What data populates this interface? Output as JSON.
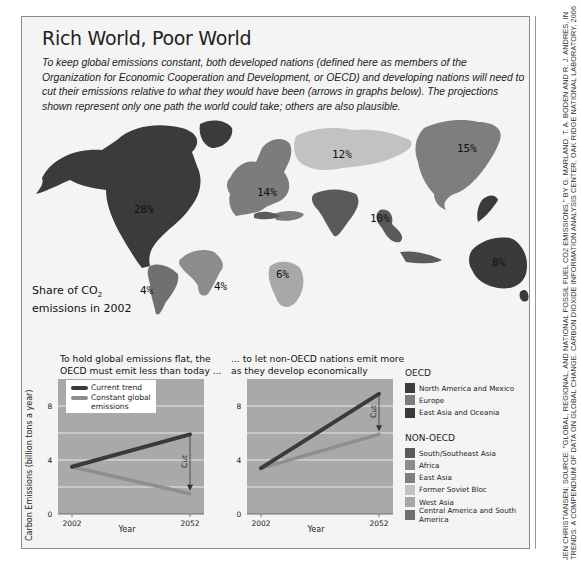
{
  "title": "Rich World, Poor World",
  "intro": "To keep global emissions constant, both developed nations (defined here as members of the Organization for Economic Cooperation and Development, or OECD) and developing nations will need to cut their emissions relative to what they would have been (arrows in graphs below). The projections shown represent only one path the world could take; others are also plausible.",
  "map": {
    "label_line1": "Share of CO",
    "label_sub": "2",
    "label_line2": "emissions in 2002",
    "regions": [
      {
        "name": "North America and Mexico",
        "group": "OECD",
        "share": "28%",
        "color": "#3b3b3b"
      },
      {
        "name": "Europe",
        "group": "OECD",
        "share": "14%",
        "color": "#7c7c7c"
      },
      {
        "name": "East Asia and Oceania",
        "group": "OECD",
        "share": "8%",
        "color": "#3a3a3a"
      },
      {
        "name": "South/Southeast Asia",
        "group": "NON-OECD",
        "share": "10%",
        "color": "#5a5a5a"
      },
      {
        "name": "Africa",
        "group": "NON-OECD",
        "share": "4%",
        "color": "#8c8c8c"
      },
      {
        "name": "East Asia",
        "group": "NON-OECD",
        "share": "15%",
        "color": "#7e7e7e"
      },
      {
        "name": "Former Soviet Bloc",
        "group": "NON-OECD",
        "share": "12%",
        "color": "#c2c2c2"
      },
      {
        "name": "West Asia",
        "group": "NON-OECD",
        "share": "6%",
        "color": "#a8a8a8"
      },
      {
        "name": "Central America and South America",
        "group": "NON-OECD",
        "share": "4%",
        "color": "#707070"
      }
    ]
  },
  "legend": {
    "oecd_heading": "OECD",
    "oecd_items": [
      "North America and Mexico",
      "Europe",
      "East Asia and Oceania"
    ],
    "non_oecd_heading": "NON-OECD",
    "non_oecd_items": [
      "South/Southeast Asia",
      "Africa",
      "East Asia",
      "Former Soviet Bloc",
      "West Asia",
      "Central America and South America"
    ],
    "line_current": "Current trend",
    "line_constant_1": "Constant global",
    "line_constant_2": "emissions"
  },
  "colors": {
    "current_trend": "#3a3a3a",
    "constant_global": "#8e8e8e",
    "plot_bg": "#a9a9a9",
    "grid": "#e8e8e8"
  },
  "chart_data": [
    {
      "type": "line",
      "title": "To hold global emissions flat, the OECD must emit less than today ...",
      "title_line1": "To hold global emissions flat, the",
      "title_line2": "OECD must emit less than today ...",
      "xlabel": "Year",
      "ylabel": "Carbon Emissions (billion tons a year)",
      "x": [
        2002,
        2052
      ],
      "xticks": [
        "2002",
        "2052"
      ],
      "yticks": [
        "0",
        "4",
        "8"
      ],
      "ylim": [
        0,
        10
      ],
      "grid": true,
      "legend": "top-left",
      "annotation": "Cut",
      "series": [
        {
          "name": "Current trend",
          "values": [
            3.5,
            5.9
          ]
        },
        {
          "name": "Constant global emissions",
          "values": [
            3.5,
            1.5
          ]
        }
      ]
    },
    {
      "type": "line",
      "title": "... to let non-OECD nations emit more as they develop economically",
      "title_line1": "... to let non-OECD nations emit more",
      "title_line2": "as they develop economically",
      "xlabel": "Year",
      "ylabel": "",
      "x": [
        2002,
        2052
      ],
      "xticks": [
        "2002",
        "2052"
      ],
      "yticks": [
        "0",
        "4",
        "8"
      ],
      "ylim": [
        0,
        10
      ],
      "grid": true,
      "annotation": "Cut",
      "series": [
        {
          "name": "Current trend",
          "values": [
            3.4,
            8.9
          ]
        },
        {
          "name": "Constant global emissions",
          "values": [
            3.4,
            5.9
          ]
        }
      ]
    }
  ],
  "credit": "JEN CHRISTIANSEN; SOURCE: \"GLOBAL, REGIONAL, AND NATIONAL FOSSIL FUEL CO2 EMISSIONS,\" BY G. MARLAND, T. A. BODEN AND R. J. ANDRES, IN TRENDS: A COMPENDIUM OF DATA ON GLOBAL CHANGE. CARBON DIOXIDE INFORMATION ANALYSIS CENTER, OAK RIDGE NATIONAL LABORATORY, 2006"
}
